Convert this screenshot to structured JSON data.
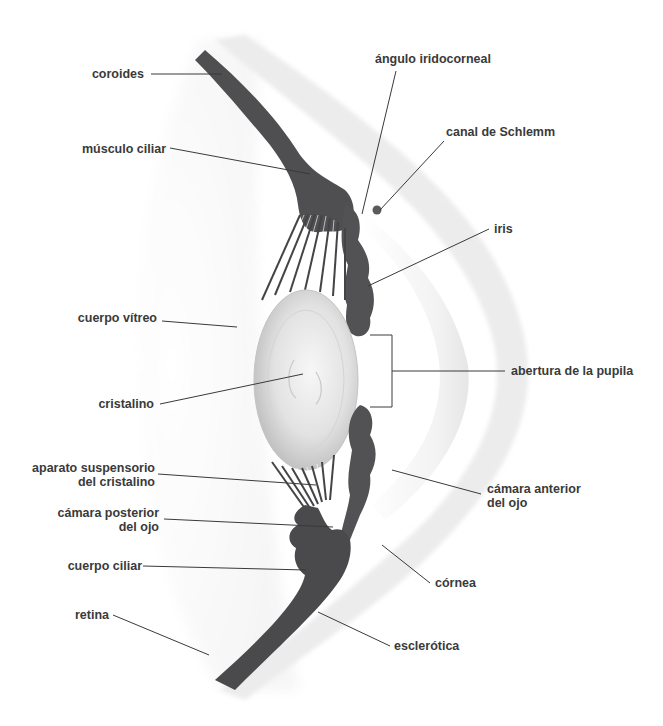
{
  "diagram": {
    "colors": {
      "tissue_dark": "#4a4a4c",
      "tissue_mid": "#5c5c5e",
      "sclera_band": "#ececec",
      "cornea_inner": "#f4f4f4",
      "lens_light": "#f3f3f3",
      "lens_edge": "#bdbdbd",
      "label_text": "#3a3a3a",
      "leader_line": "#3a3a3a"
    },
    "labels": {
      "coroides": "coroides",
      "musculo_ciliar": "músculo ciliar",
      "angulo_iridocorneal": "ángulo iridocorneal",
      "canal_schlemm": "canal de Schlemm",
      "iris": "iris",
      "cuerpo_vitreo": "cuerpo vítreo",
      "cristalino": "cristalino",
      "abertura_pupila": "abertura de la pupila",
      "aparato_suspensorio_1": "aparato suspensorio",
      "aparato_suspensorio_2": "del cristalino",
      "camara_posterior_1": "cámara posterior",
      "camara_posterior_2": "del ojo",
      "camara_anterior_1": "cámara anterior",
      "camara_anterior_2": "del ojo",
      "cuerpo_ciliar": "cuerpo ciliar",
      "cornea": "córnea",
      "retina": "retina",
      "esclerotica": "esclerótica"
    }
  }
}
